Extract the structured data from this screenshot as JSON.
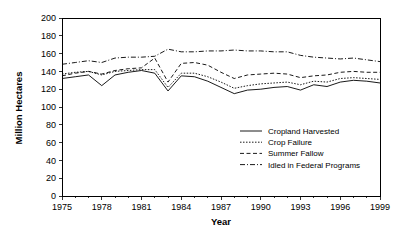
{
  "chart_data": {
    "type": "line",
    "title": "",
    "xlabel": "Year",
    "ylabel": "Million Hectares",
    "xlim": [
      1975,
      1999
    ],
    "ylim": [
      0,
      200
    ],
    "grid": false,
    "legend_position": "inside-center-right",
    "x": [
      1975,
      1976,
      1977,
      1978,
      1979,
      1980,
      1981,
      1982,
      1983,
      1984,
      1985,
      1986,
      1987,
      1988,
      1989,
      1990,
      1991,
      1992,
      1993,
      1994,
      1995,
      1996,
      1997,
      1998,
      1999
    ],
    "xticks": [
      1975,
      1978,
      1981,
      1984,
      1987,
      1990,
      1993,
      1996,
      1999
    ],
    "xtick_labels": [
      "1975",
      "1978",
      "1981",
      "1984",
      "1987",
      "1990",
      "1993",
      "1996",
      "1999"
    ],
    "yticks": [
      0,
      20,
      40,
      60,
      80,
      100,
      120,
      140,
      160,
      180,
      200
    ],
    "ytick_labels": [
      "0",
      "20",
      "40",
      "60",
      "80",
      "100",
      "120",
      "140",
      "160",
      "180",
      "200"
    ],
    "series": [
      {
        "name": "Cropland Harvested",
        "style": "solid",
        "dasharray": "",
        "values": [
          132,
          134,
          136,
          124,
          136,
          139,
          141,
          138,
          118,
          135,
          134,
          129,
          122,
          115,
          119,
          120,
          122,
          123,
          119,
          125,
          123,
          128,
          130,
          129,
          127
        ]
      },
      {
        "name": "Crop Failure",
        "style": "dotted",
        "dasharray": "1.5,1.5",
        "values": [
          137,
          139,
          140,
          136,
          140,
          141,
          142,
          142,
          122,
          138,
          138,
          134,
          128,
          121,
          124,
          126,
          127,
          128,
          125,
          129,
          128,
          132,
          133,
          132,
          131
        ]
      },
      {
        "name": "Summer Fallow",
        "style": "dashed",
        "dasharray": "4,2.5",
        "values": [
          135,
          138,
          140,
          137,
          141,
          143,
          144,
          155,
          128,
          149,
          150,
          147,
          139,
          132,
          136,
          137,
          138,
          137,
          133,
          135,
          136,
          139,
          140,
          139,
          139
        ]
      },
      {
        "name": "Idled in Federal Programs",
        "style": "dash-dot",
        "dasharray": "5,2,1,2",
        "values": [
          148,
          150,
          152,
          150,
          155,
          156,
          156,
          157,
          165,
          162,
          162,
          163,
          163,
          164,
          163,
          163,
          162,
          162,
          158,
          156,
          155,
          154,
          155,
          153,
          151
        ]
      }
    ]
  },
  "colors": {
    "axis": "#000000",
    "background": "#ffffff",
    "line": "#000000"
  }
}
